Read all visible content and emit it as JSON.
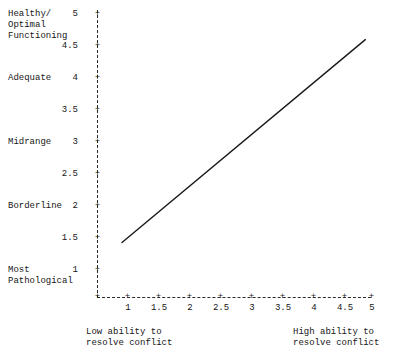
{
  "chart_data": {
    "type": "line",
    "title": "",
    "xlabel": "",
    "ylabel": "",
    "xlim": [
      0.7,
      5.4
    ],
    "ylim": [
      0.7,
      5.2
    ],
    "grid": false,
    "legend": null,
    "x_ticks": [
      "1",
      "1.5",
      "2",
      "2.5",
      "3",
      "3.5",
      "4",
      "4.5",
      "5"
    ],
    "x_tick_values": [
      1,
      1.5,
      2,
      2.5,
      3,
      3.5,
      4,
      4.5,
      5
    ],
    "y_ticks": [
      "1",
      "1.5",
      "2",
      "2.5",
      "3",
      "3.5",
      "4",
      "4.5",
      "5"
    ],
    "y_tick_values": [
      1,
      1.5,
      2,
      2.5,
      3,
      3.5,
      4,
      4.5,
      5
    ],
    "y_category_labels": [
      {
        "value": 5,
        "label": "Healthy/\nOptimal\nFunctioning"
      },
      {
        "value": 4,
        "label": "Adequate"
      },
      {
        "value": 3,
        "label": "Midrange"
      },
      {
        "value": 2,
        "label": "Borderline"
      },
      {
        "value": 1,
        "label": "Most\nPathological"
      }
    ],
    "x_axis_captions": {
      "left": "Low ability to\nresolve conflict",
      "right": "High ability to\nresolve conflict"
    },
    "series": [
      {
        "name": "",
        "points": [
          {
            "x": 1.4,
            "y": 1.43
          },
          {
            "x": 5.3,
            "y": 4.6
          }
        ],
        "color": "#1a1a1a",
        "width": 1.4,
        "style": "solid"
      }
    ],
    "axis_style": {
      "color": "#2b2b2b",
      "style": "dashed",
      "tick_glyph": "+"
    }
  }
}
